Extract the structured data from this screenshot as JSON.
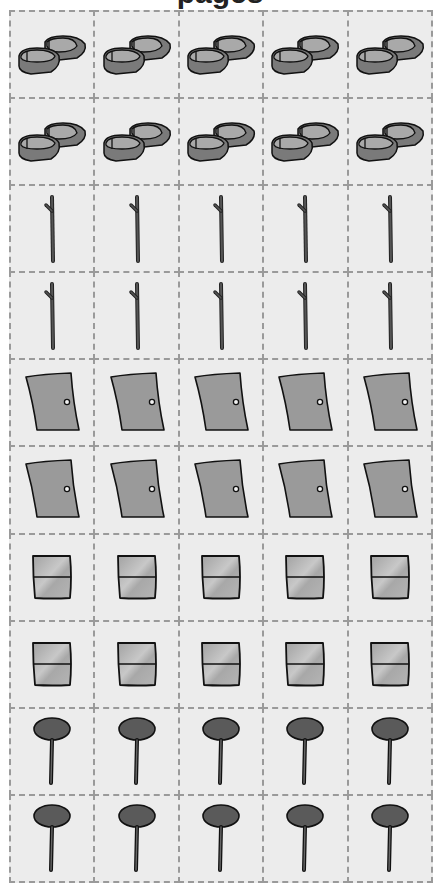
{
  "header": {
    "title": "pages"
  },
  "grid": {
    "columns": 5,
    "rows": 10,
    "colors": {
      "cell_background": "#ececec",
      "border": "#9a9a9a"
    },
    "row_items": [
      {
        "icon": "shoes-icon",
        "count": 5
      },
      {
        "icon": "shoes-icon",
        "count": 5
      },
      {
        "icon": "stick-icon",
        "count": 5
      },
      {
        "icon": "stick-icon",
        "count": 5
      },
      {
        "icon": "door-icon",
        "count": 5
      },
      {
        "icon": "door-icon",
        "count": 5
      },
      {
        "icon": "box-icon",
        "count": 5
      },
      {
        "icon": "box-icon",
        "count": 5
      },
      {
        "icon": "lollipop-icon",
        "count": 5
      },
      {
        "icon": "lollipop-icon",
        "count": 5
      }
    ]
  }
}
